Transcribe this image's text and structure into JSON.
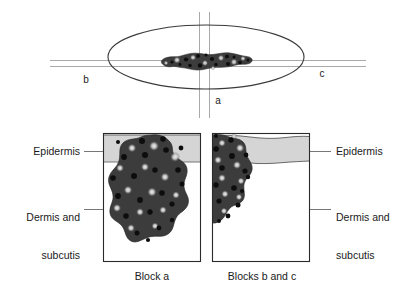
{
  "figure": {
    "title_absent": true,
    "top_schematic": {
      "name": "surface-view-of-lesion-with-section-planes",
      "axis_labels": {
        "b": "b",
        "c": "c",
        "a": "a"
      },
      "ellipse": {
        "description": "skin-surface-outline",
        "stroke": "#3a3a3a"
      },
      "lesion": {
        "description": "irregular-pigmented-lesion",
        "fill": "#3b3b3b"
      },
      "section_lines": {
        "stroke": "#aaaaaa",
        "horizontal_pair": true,
        "vertical_pair": true
      }
    },
    "blocks": [
      {
        "name": "block-a",
        "caption": "Block a",
        "lesion_position": "central-broad"
      },
      {
        "name": "blocks-b-and-c",
        "caption": "Blocks b and c",
        "lesion_position": "left-edge-peripheral"
      }
    ],
    "annotations": {
      "left": [
        {
          "text": "Epidermis",
          "target": "block-a-epidermis"
        },
        {
          "text": "Dermis and\nsubcutis",
          "line1": "Dermis and",
          "line2": "subcutis",
          "target": "block-a-dermis"
        }
      ],
      "right": [
        {
          "text": "Epidermis",
          "target": "blocks-bc-epidermis"
        },
        {
          "text": "Dermis and\nsubcutis",
          "line1": "Dermis and",
          "line2": "subcutis",
          "target": "blocks-bc-dermis"
        }
      ]
    },
    "colors": {
      "epidermis_fill": "#d5d5d5",
      "epidermis_stroke": "#5a5a5a",
      "lesion_fill": "#3c3c3c",
      "lesion_dot": "#101010",
      "lesion_highlight": "#e8e8e8",
      "block_border": "#2a2a2a",
      "block_fill": "#ffffff",
      "leader_line": "#777777",
      "text": "#1a1a1a",
      "background": "#ffffff"
    }
  }
}
